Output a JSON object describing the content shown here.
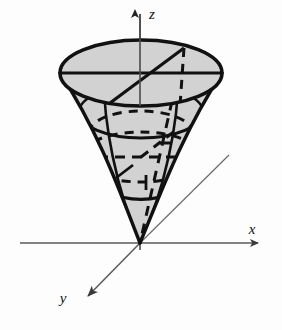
{
  "figure": {
    "background_color": "#fdfdfd",
    "solid_fill_color": "#d2d2d2",
    "outline_color": "#111111",
    "axis_color": "#5a5a5a",
    "hidden_line_style": "dashed"
  },
  "axes": {
    "z": {
      "label": "z",
      "direction": "up",
      "arrow": true,
      "label_x": 152,
      "label_y": 16
    },
    "x": {
      "label": "x",
      "direction": "right",
      "arrow": true,
      "label_x": 252,
      "label_y": 234
    },
    "y": {
      "label": "y",
      "direction": "down-left",
      "arrow": true,
      "label_x": 63,
      "label_y": 302
    },
    "origin": {
      "x": 140,
      "y": 243,
      "label": ""
    }
  },
  "surfaces": [
    {
      "name": "paraboloid",
      "kind": "paraboloid",
      "opens": "up",
      "vertex_at_origin": true,
      "shaded": true
    },
    {
      "name": "top-disk",
      "kind": "ellipse",
      "center_x": 141,
      "center_y": 73,
      "radius_x": 81,
      "radius_y": 33,
      "shaded": true
    },
    {
      "name": "inner-sphere",
      "kind": "sphere",
      "center_x": 141,
      "center_y": 157,
      "radius": 60,
      "hidden": true
    }
  ],
  "guides": [
    {
      "name": "top-diameter",
      "style": "solid"
    },
    {
      "name": "top-radius-to-rim",
      "style": "solid"
    },
    {
      "name": "vertical-hidden-chord",
      "style": "dashed"
    },
    {
      "name": "sphere-equator",
      "style": "dashed"
    },
    {
      "name": "sphere-horizontal-diameter",
      "style": "dashed"
    },
    {
      "name": "intersection-circle",
      "style": "solid"
    },
    {
      "name": "negative-y-ray",
      "style": "solid-thin"
    }
  ]
}
